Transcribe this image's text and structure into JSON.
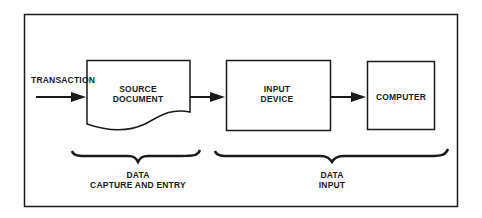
{
  "diagram": {
    "input_label": "TRANSACTION",
    "nodes": [
      {
        "id": "source-document",
        "line1": "SOURCE",
        "line2": "DOCUMENT"
      },
      {
        "id": "input-device",
        "line1": "INPUT",
        "line2": "DEVICE"
      },
      {
        "id": "computer",
        "line1": "COMPUTER"
      }
    ],
    "groups": [
      {
        "id": "data-capture-and-entry",
        "line1": "DATA",
        "line2": "CAPTURE AND ENTRY"
      },
      {
        "id": "data-input",
        "line1": "DATA",
        "line2": "INPUT"
      }
    ],
    "colors": {
      "stroke": "#1a1a1a",
      "background": "#ffffff"
    }
  }
}
